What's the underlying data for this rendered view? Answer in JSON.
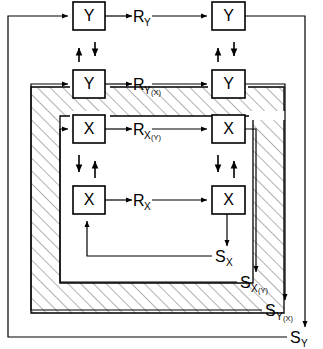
{
  "diagram": {
    "background": "#ffffff",
    "stroke_color": "#000000",
    "hatch_color": "#7a7a7a",
    "width": 323,
    "height": 349,
    "nodes": [
      {
        "id": "y_top_left",
        "label": "Y",
        "x": 73,
        "y": 2,
        "w": 32,
        "h": 28
      },
      {
        "id": "y_top_right",
        "label": "Y",
        "x": 212,
        "y": 2,
        "w": 33,
        "h": 28
      },
      {
        "id": "y_mid_left",
        "label": "Y",
        "x": 73,
        "y": 70,
        "w": 32,
        "h": 28
      },
      {
        "id": "y_mid_right",
        "label": "Y",
        "x": 212,
        "y": 70,
        "w": 33,
        "h": 28
      },
      {
        "id": "x_mid_left",
        "label": "X",
        "x": 73,
        "y": 115,
        "w": 32,
        "h": 28
      },
      {
        "id": "x_mid_right",
        "label": "X",
        "x": 212,
        "y": 115,
        "w": 33,
        "h": 28
      },
      {
        "id": "x_bot_left",
        "label": "X",
        "x": 73,
        "y": 186,
        "w": 32,
        "h": 28
      },
      {
        "id": "x_bot_right",
        "label": "X",
        "x": 212,
        "y": 186,
        "w": 33,
        "h": 28
      }
    ],
    "signal_labels": [
      {
        "id": "r_y",
        "base": "R",
        "sub": "Y",
        "sub2": "",
        "x": 140,
        "y": 16
      },
      {
        "id": "r_y_x",
        "base": "R",
        "sub": "Y",
        "sub2": "(X)",
        "x": 140,
        "y": 84
      },
      {
        "id": "r_x_y",
        "base": "R",
        "sub": "X",
        "sub2": "(Y)",
        "x": 140,
        "y": 129
      },
      {
        "id": "r_x",
        "base": "R",
        "sub": "X",
        "sub2": "",
        "x": 140,
        "y": 200
      },
      {
        "id": "s_x",
        "base": "S",
        "sub": "X",
        "sub2": "",
        "x": 222,
        "y": 256
      },
      {
        "id": "s_x_y",
        "base": "S",
        "sub": "X",
        "sub2": "(Y)",
        "x": 247,
        "y": 282
      },
      {
        "id": "s_y_x",
        "base": "S",
        "sub": "Y",
        "sub2": "(X)",
        "x": 272,
        "y": 310
      },
      {
        "id": "s_y",
        "base": "S",
        "sub": "Y",
        "sub2": "",
        "x": 297,
        "y": 337
      }
    ],
    "vertical_arrow_pairs": [
      {
        "id": "pair-left-top",
        "x_up": 79,
        "x_down": 95,
        "y_top": 42,
        "y_bottom": 62,
        "left_dir": "up",
        "right_dir": "down"
      },
      {
        "id": "pair-right-top",
        "x_up": 218,
        "x_down": 234,
        "y_top": 42,
        "y_bottom": 62,
        "left_dir": "up",
        "right_dir": "down"
      },
      {
        "id": "pair-left-bot",
        "x_up": 95,
        "x_down": 79,
        "y_top": 155,
        "y_bottom": 178,
        "left_dir": "down",
        "right_dir": "up"
      },
      {
        "id": "pair-right-bot",
        "x_up": 234,
        "x_down": 218,
        "y_top": 155,
        "y_bottom": 178,
        "left_dir": "down",
        "right_dir": "up"
      }
    ],
    "loops": [
      {
        "id": "loop-outer-y",
        "label": "S_Y outer feedback",
        "left_x": 8,
        "top_y": 22,
        "bottom_y": 337
      },
      {
        "id": "loop-y-x",
        "label": "S_Y(X) feedback",
        "left_x": 31,
        "top_y": 87,
        "bottom_y": 313
      },
      {
        "id": "loop-x-y",
        "label": "S_X(Y) feedback",
        "left_x": 60,
        "top_y": 129,
        "bottom_y": 283
      },
      {
        "id": "loop-inner-x",
        "label": "S_X inner feedback",
        "left_x": 87,
        "top_y": 200,
        "bottom_y": 256
      }
    ],
    "hatched_bands": [
      {
        "id": "band-outer",
        "outer_x": 31,
        "outer_y": 87,
        "outer_w": 253,
        "outer_h": 226,
        "inner_x": 60,
        "inner_y": 116,
        "inner_w": 193,
        "inner_h": 167
      }
    ]
  }
}
